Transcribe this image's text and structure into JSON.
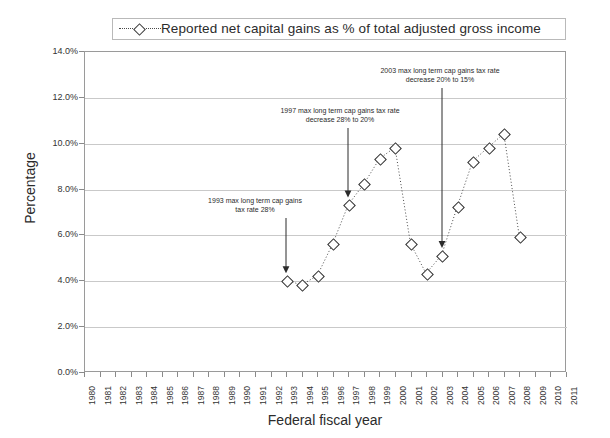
{
  "chart_data": {
    "type": "line",
    "title": "",
    "legend": [
      "Reported net capital gains as % of total adjusted gross income"
    ],
    "legend_position": "top-center",
    "xlabel": "Federal fiscal year",
    "ylabel": "Percentage",
    "ylim": [
      0,
      14
    ],
    "ytick_labels": [
      "0.0%",
      "2.0%",
      "4.0%",
      "6.0%",
      "8.0%",
      "10.0%",
      "12.0%",
      "14.0%"
    ],
    "ytick_values": [
      0,
      2,
      4,
      6,
      8,
      10,
      12,
      14
    ],
    "xtick_labels": [
      "1980",
      "1981",
      "1982",
      "1983",
      "1984",
      "1985",
      "1986",
      "1987",
      "1988",
      "1989",
      "1990",
      "1991",
      "1992",
      "1993",
      "1994",
      "1995",
      "1996",
      "1997",
      "1998",
      "1999",
      "2000",
      "2001",
      "2002",
      "2003",
      "2004",
      "2005",
      "2006",
      "2007",
      "2008",
      "2009",
      "2010",
      "2011"
    ],
    "x": [
      1993,
      1994,
      1995,
      1996,
      1997,
      1998,
      1999,
      2000,
      2001,
      2002,
      2003,
      2004,
      2005,
      2006,
      2007,
      2008
    ],
    "values": [
      4.0,
      3.8,
      4.2,
      5.6,
      7.3,
      8.2,
      9.3,
      9.8,
      5.6,
      4.3,
      5.1,
      7.2,
      9.2,
      9.8,
      10.4,
      5.9
    ],
    "grid": true,
    "marker": "diamond",
    "line_style": "dotted",
    "series": [
      {
        "name": "Reported net capital gains as % of total adjusted gross income",
        "x": [
          1993,
          1994,
          1995,
          1996,
          1997,
          1998,
          1999,
          2000,
          2001,
          2002,
          2003,
          2004,
          2005,
          2006,
          2007,
          2008
        ],
        "values": [
          4.0,
          3.8,
          4.2,
          5.6,
          7.3,
          8.2,
          9.3,
          9.8,
          5.6,
          4.3,
          5.1,
          7.2,
          9.2,
          9.8,
          10.4,
          5.9
        ]
      }
    ],
    "annotations": [
      {
        "id": "ann-1993",
        "line1": "1993 max long term cap gains",
        "line2": "tax rate 28%",
        "target_year": 1993,
        "target_value": 4.0
      },
      {
        "id": "ann-1997",
        "line1": "1997 max long term cap gains tax rate",
        "line2": "decrease 28% to 20%",
        "target_year": 1997,
        "target_value": 7.3
      },
      {
        "id": "ann-2003",
        "line1": "2003 max long term cap gains tax rate",
        "line2": "decrease 20% to 15%",
        "target_year": 2003,
        "target_value": 5.1
      }
    ],
    "colors": {
      "line": "#4a4a4a",
      "marker_edge": "#2e2e2e",
      "marker_fill": "#ffffff",
      "grid": "#c9c9c9",
      "axis": "#9a9a9a",
      "text": "#2b2b2b"
    }
  }
}
